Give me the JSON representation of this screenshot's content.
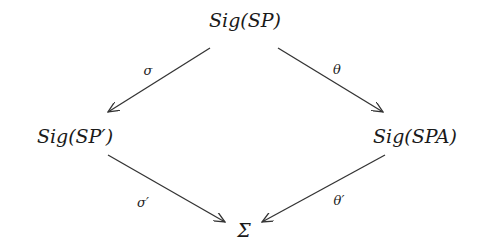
{
  "diagram": {
    "nodes": {
      "top": "Sig(SP)",
      "left": "Sig(SP′)",
      "right": "Sig(SPA)",
      "bottom": "Σ"
    },
    "edges": [
      {
        "from": "Sig(SP)",
        "to": "Sig(SP′)",
        "label": "σ"
      },
      {
        "from": "Sig(SP)",
        "to": "Sig(SPA)",
        "label": "θ"
      },
      {
        "from": "Sig(SP′)",
        "to": "Σ",
        "label": "σ′"
      },
      {
        "from": "Sig(SPA)",
        "to": "Σ",
        "label": "θ′"
      }
    ],
    "colors": {
      "arrow": "#333333",
      "text": "#1a1a1a",
      "background": "#ffffff"
    }
  }
}
